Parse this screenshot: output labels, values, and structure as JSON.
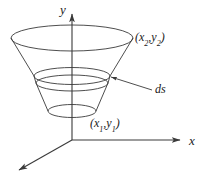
{
  "figure": {
    "kind": "surface-of-revolution-diagram",
    "background_color": "#ffffff",
    "stroke_color": "#3a3a3a",
    "text_color": "#1a1a1a"
  },
  "axes": {
    "y_label": "y",
    "x_label": "x",
    "z_label": "",
    "origin": {
      "x": 72,
      "y": 140
    },
    "y_axis": {
      "from": [
        72,
        140
      ],
      "to": [
        72,
        12
      ],
      "arrow": true
    },
    "x_axis": {
      "from": [
        72,
        140
      ],
      "to": [
        182,
        140
      ],
      "arrow": true
    },
    "z_axis": {
      "from": [
        72,
        140
      ],
      "to": [
        16,
        172
      ],
      "arrow": true
    }
  },
  "surface": {
    "top_ellipse": {
      "cx": 72,
      "cy": 38,
      "rx": 61,
      "ry": 13
    },
    "band_upper": {
      "cx": 72,
      "cy": 76,
      "rx": 38,
      "ry": 8
    },
    "band_lower": {
      "cx": 72,
      "cy": 83,
      "rx": 36,
      "ry": 8
    },
    "bottom_ellipse": {
      "cx": 72,
      "cy": 111,
      "rx": 24,
      "ry": 6
    }
  },
  "labels": {
    "point_upper": {
      "open": "(",
      "var_x": "x",
      "sub_x": "2",
      "comma": ",",
      "var_y": "y",
      "sub_y": "2",
      "close": ")",
      "text": "(x2,y2)"
    },
    "point_lower": {
      "open": "(",
      "var_x": "x",
      "sub_x": "1",
      "comma": ",",
      "var_y": "y",
      "sub_y": "1",
      "close": ")",
      "text": "(x1,y1)"
    },
    "arc_element": "ds",
    "axis_y": "y",
    "axis_x": "x"
  },
  "leader_line": {
    "name": "ds-leader",
    "from": [
      152,
      90
    ],
    "to": [
      109,
      77
    ],
    "arrow": true
  }
}
